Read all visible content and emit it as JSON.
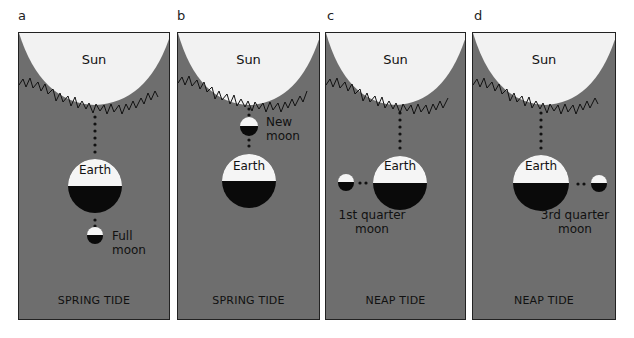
{
  "panels": [
    {
      "letter": "a",
      "sun": "Sun",
      "earth": "Earth",
      "moon_label_1": "Full",
      "moon_label_2": "moon",
      "tide": "SPRING TIDE",
      "moon_position": "below-earth"
    },
    {
      "letter": "b",
      "sun": "Sun",
      "earth": "Earth",
      "moon_label_1": "New",
      "moon_label_2": "moon",
      "tide": "SPRING TIDE",
      "moon_position": "between-sun-earth"
    },
    {
      "letter": "c",
      "sun": "Sun",
      "earth": "Earth",
      "moon_label_1": "1st quarter",
      "moon_label_2": "moon",
      "tide": "NEAP TIDE",
      "moon_position": "left-of-earth"
    },
    {
      "letter": "d",
      "sun": "Sun",
      "earth": "Earth",
      "moon_label_1": "3rd quarter",
      "moon_label_2": "moon",
      "tide": "NEAP TIDE",
      "moon_position": "right-of-earth"
    }
  ],
  "colors": {
    "background": "#6e6e6e",
    "sun": "#f2f2f2",
    "earth_dark": "#0a0a0a",
    "earth_light": "#f5f5f5"
  }
}
